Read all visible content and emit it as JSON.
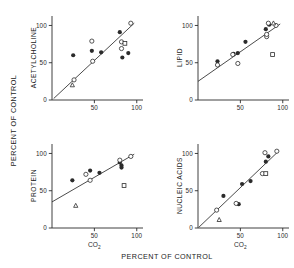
{
  "figure": {
    "global_ylabel": "PERCENT OF CONTROL",
    "global_xlabel": "PERCENT OF CONTROL",
    "tick_0": "0",
    "tick_50": "50",
    "tick_100": "100",
    "co2_label": "CO",
    "co2_sub": "2"
  },
  "panels": {
    "acetylcholine": {
      "ylabel": "ACETYLCHOLINE"
    },
    "lipid": {
      "ylabel": "LIPID"
    },
    "protein": {
      "ylabel": "PROTEIN"
    },
    "nucleic_acids": {
      "ylabel": "NUCLEIC ACIDS"
    }
  },
  "chart_data": [
    {
      "type": "scatter",
      "title": "",
      "panel": "acetylcholine",
      "xlabel": "CO2",
      "ylabel": "ACETYLCHOLINE",
      "axis_note": "Both axes: PERCENT OF CONTROL",
      "xlim": [
        0,
        105
      ],
      "ylim": [
        0,
        110
      ],
      "xticks": [
        0,
        50,
        100
      ],
      "yticks": [
        0,
        50,
        100
      ],
      "grid": false,
      "legend": "none",
      "fit_line": {
        "x": [
          2,
          97
        ],
        "y": [
          2,
          103
        ]
      },
      "series": [
        {
          "name": "filled-circle",
          "marker": "filled-circle",
          "points": [
            {
              "x": 25,
              "y": 60
            },
            {
              "x": 47,
              "y": 66
            },
            {
              "x": 58,
              "y": 64
            },
            {
              "x": 80,
              "y": 91
            },
            {
              "x": 83,
              "y": 57
            },
            {
              "x": 90,
              "y": 63
            }
          ]
        },
        {
          "name": "open-circle",
          "marker": "open-circle",
          "points": [
            {
              "x": 47,
              "y": 79
            },
            {
              "x": 48,
              "y": 52
            },
            {
              "x": 82,
              "y": 78
            },
            {
              "x": 82,
              "y": 69
            },
            {
              "x": 93,
              "y": 103
            },
            {
              "x": 26,
              "y": 27
            }
          ]
        },
        {
          "name": "open-square",
          "marker": "open-square",
          "points": [
            {
              "x": 86,
              "y": 76
            }
          ]
        },
        {
          "name": "open-triangle",
          "marker": "open-triangle",
          "points": [
            {
              "x": 24,
              "y": 20
            }
          ]
        }
      ]
    },
    {
      "type": "scatter",
      "title": "",
      "panel": "lipid",
      "xlabel": "CO2",
      "ylabel": "LIPID",
      "axis_note": "Both axes: PERCENT OF CONTROL",
      "xlim": [
        0,
        105
      ],
      "ylim": [
        0,
        110
      ],
      "xticks": [
        0,
        50,
        100
      ],
      "yticks": [
        0,
        50,
        100
      ],
      "grid": false,
      "legend": "none",
      "fit_line": {
        "x": [
          0,
          97
        ],
        "y": [
          25,
          102
        ]
      },
      "series": [
        {
          "name": "filled-circle",
          "marker": "filled-circle",
          "points": [
            {
              "x": 23,
              "y": 52
            },
            {
              "x": 42,
              "y": 62
            },
            {
              "x": 47,
              "y": 63
            },
            {
              "x": 56,
              "y": 78
            },
            {
              "x": 80,
              "y": 95
            },
            {
              "x": 84,
              "y": 101
            }
          ]
        },
        {
          "name": "open-circle",
          "marker": "open-circle",
          "points": [
            {
              "x": 23,
              "y": 47
            },
            {
              "x": 41,
              "y": 61
            },
            {
              "x": 47,
              "y": 49
            },
            {
              "x": 81,
              "y": 85
            },
            {
              "x": 81,
              "y": 88
            },
            {
              "x": 83,
              "y": 103
            },
            {
              "x": 92,
              "y": 100
            }
          ]
        },
        {
          "name": "open-square",
          "marker": "open-square",
          "points": [
            {
              "x": 88,
              "y": 61
            }
          ]
        },
        {
          "name": "open-triangle",
          "marker": "open-triangle",
          "points": [
            {
              "x": 89,
              "y": 103
            }
          ]
        }
      ]
    },
    {
      "type": "scatter",
      "title": "",
      "panel": "protein",
      "xlabel": "CO2",
      "ylabel": "PROTEIN",
      "axis_note": "Both axes: PERCENT OF CONTROL",
      "xlim": [
        0,
        105
      ],
      "ylim": [
        0,
        110
      ],
      "xticks": [
        0,
        50,
        100
      ],
      "yticks": [
        0,
        50,
        100
      ],
      "grid": false,
      "legend": "none",
      "fit_line": {
        "x": [
          0,
          97
        ],
        "y": [
          35,
          99
        ]
      },
      "series": [
        {
          "name": "filled-circle",
          "marker": "filled-circle",
          "points": [
            {
              "x": 24,
              "y": 64
            },
            {
              "x": 45,
              "y": 77
            },
            {
              "x": 56,
              "y": 74
            },
            {
              "x": 80,
              "y": 88
            },
            {
              "x": 82,
              "y": 81
            },
            {
              "x": 82,
              "y": 84
            }
          ]
        },
        {
          "name": "open-circle",
          "marker": "open-circle",
          "points": [
            {
              "x": 40,
              "y": 72
            },
            {
              "x": 45,
              "y": 64
            },
            {
              "x": 80,
              "y": 91
            },
            {
              "x": 93,
              "y": 96
            }
          ]
        },
        {
          "name": "open-square",
          "marker": "open-square",
          "points": [
            {
              "x": 85,
              "y": 57
            }
          ]
        },
        {
          "name": "open-triangle",
          "marker": "open-triangle",
          "points": [
            {
              "x": 28,
              "y": 30
            }
          ]
        }
      ]
    },
    {
      "type": "scatter",
      "title": "",
      "panel": "nucleic_acids",
      "xlabel": "CO2",
      "ylabel": "NUCLEIC ACIDS",
      "axis_note": "Both axes: PERCENT OF CONTROL",
      "xlim": [
        0,
        105
      ],
      "ylim": [
        0,
        110
      ],
      "xticks": [
        0,
        50,
        100
      ],
      "yticks": [
        0,
        50,
        100
      ],
      "grid": false,
      "legend": "none",
      "fit_line": {
        "x": [
          1,
          95
        ],
        "y": [
          1,
          103
        ]
      },
      "series": [
        {
          "name": "filled-circle",
          "marker": "filled-circle",
          "points": [
            {
              "x": 30,
              "y": 43
            },
            {
              "x": 48,
              "y": 32
            },
            {
              "x": 52,
              "y": 59
            },
            {
              "x": 62,
              "y": 63
            },
            {
              "x": 80,
              "y": 89
            },
            {
              "x": 83,
              "y": 96
            }
          ]
        },
        {
          "name": "open-circle",
          "marker": "open-circle",
          "points": [
            {
              "x": 22,
              "y": 24
            },
            {
              "x": 45,
              "y": 33
            },
            {
              "x": 79,
              "y": 101
            },
            {
              "x": 93,
              "y": 103
            },
            {
              "x": 76,
              "y": 73
            }
          ]
        },
        {
          "name": "open-square",
          "marker": "open-square",
          "points": [
            {
              "x": 80,
              "y": 73
            }
          ]
        },
        {
          "name": "open-triangle",
          "marker": "open-triangle",
          "points": [
            {
              "x": 25,
              "y": 11
            }
          ]
        }
      ]
    }
  ]
}
